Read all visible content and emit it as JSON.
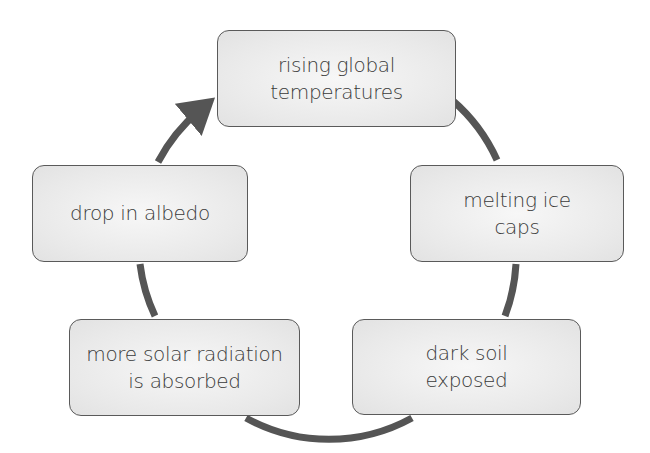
{
  "diagram": {
    "type": "cycle",
    "arrow_color": "#555555",
    "box_fill": "#eaeaea",
    "box_border": "#5a5a5a",
    "nodes": [
      {
        "id": "rising-global-temperatures",
        "label": "rising global\ntemperatures"
      },
      {
        "id": "melting-ice-caps",
        "label": "melting ice\ncaps"
      },
      {
        "id": "dark-soil-exposed",
        "label": "dark soil\nexposed"
      },
      {
        "id": "more-solar-radiation-absorbed",
        "label": "more solar radiation\nis absorbed"
      },
      {
        "id": "drop-in-albedo",
        "label": "drop in albedo"
      }
    ],
    "flow": [
      [
        "rising global temperatures",
        "melting ice caps"
      ],
      [
        "melting ice caps",
        "dark soil exposed"
      ],
      [
        "dark soil exposed",
        "more solar radiation is absorbed"
      ],
      [
        "more solar radiation is absorbed",
        "drop in albedo"
      ],
      [
        "drop in albedo",
        "rising global temperatures"
      ]
    ]
  }
}
